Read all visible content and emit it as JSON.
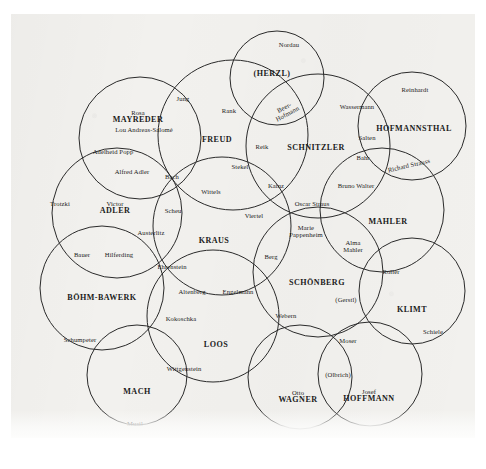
{
  "document": {
    "type": "venn-diagram-sociogram",
    "subject": "Vienna fin-de-siecle intellectual circles",
    "header_ghost_text": "",
    "background_color": "#f2f1ee",
    "ink_color": "#1b1b1b",
    "circle_stroke_color": "#2a2a2a"
  },
  "circles": [
    {
      "id": "mayreder",
      "cx": 140,
      "cy": 138,
      "r": 61
    },
    {
      "id": "freud",
      "cx": 233,
      "cy": 135,
      "r": 75
    },
    {
      "id": "herzl",
      "cx": 277,
      "cy": 78,
      "r": 47
    },
    {
      "id": "schnitzler",
      "cx": 318,
      "cy": 146,
      "r": 72
    },
    {
      "id": "hofmannsthal",
      "cx": 412,
      "cy": 126,
      "r": 54
    },
    {
      "id": "victor_adler",
      "cx": 117,
      "cy": 213,
      "r": 65
    },
    {
      "id": "kraus",
      "cx": 222,
      "cy": 226,
      "r": 69
    },
    {
      "id": "mahler",
      "cx": 382,
      "cy": 210,
      "r": 62
    },
    {
      "id": "schonberg",
      "cx": 318,
      "cy": 272,
      "r": 65
    },
    {
      "id": "bohm_bawerk",
      "cx": 102,
      "cy": 288,
      "r": 62
    },
    {
      "id": "loos",
      "cx": 213,
      "cy": 316,
      "r": 66
    },
    {
      "id": "klimt",
      "cx": 412,
      "cy": 291,
      "r": 53
    },
    {
      "id": "mach",
      "cx": 137,
      "cy": 375,
      "r": 50
    },
    {
      "id": "josef_hoffmann",
      "cx": 370,
      "cy": 374,
      "r": 52
    },
    {
      "id": "otto_wagner",
      "cx": 300,
      "cy": 377,
      "r": 52
    }
  ],
  "major_labels": [
    {
      "id": "mayreder",
      "given": "Rosa",
      "family": "MAYREDER",
      "x": 138,
      "y": 117
    },
    {
      "id": "freud",
      "given": "",
      "family": "FREUD",
      "x": 217,
      "y": 140
    },
    {
      "id": "herzl",
      "given": "",
      "family": "(HERZL)",
      "x": 272,
      "y": 74
    },
    {
      "id": "schnitzler",
      "given": "",
      "family": "SCHNITZLER",
      "x": 316,
      "y": 148
    },
    {
      "id": "hofmannsthal",
      "given": "",
      "family": "HOFMANNSTHAL",
      "x": 414,
      "y": 129
    },
    {
      "id": "victor_adler",
      "given": "Victor",
      "family": "ADLER",
      "x": 115,
      "y": 208
    },
    {
      "id": "kraus",
      "given": "",
      "family": "KRAUS",
      "x": 214,
      "y": 241
    },
    {
      "id": "mahler",
      "given": "",
      "family": "MAHLER",
      "x": 388,
      "y": 222
    },
    {
      "id": "schonberg",
      "given": "",
      "family": "SCHÖNBERG",
      "x": 317,
      "y": 283
    },
    {
      "id": "bohm_bawerk",
      "given": "",
      "family": "BÖHM-BAWERK",
      "x": 102,
      "y": 298
    },
    {
      "id": "loos",
      "given": "",
      "family": "LOOS",
      "x": 216,
      "y": 345
    },
    {
      "id": "klimt",
      "given": "",
      "family": "KLIMT",
      "x": 412,
      "y": 310
    },
    {
      "id": "mach",
      "given": "",
      "family": "MACH",
      "x": 137,
      "y": 392
    },
    {
      "id": "josef_hoffmann",
      "given": "Josef",
      "family": "HOFFMANN",
      "x": 369,
      "y": 396
    },
    {
      "id": "otto_wagner",
      "given": "Otto",
      "family": "WAGNER",
      "x": 298,
      "y": 397
    }
  ],
  "minor_labels": [
    {
      "id": "nordau",
      "text": "Nordau",
      "x": 289,
      "y": 45
    },
    {
      "id": "reinhardt",
      "text": "Reinhardt",
      "x": 415,
      "y": 90
    },
    {
      "id": "jung",
      "text": "Jung",
      "x": 183,
      "y": 99
    },
    {
      "id": "rank",
      "text": "Rank",
      "x": 229,
      "y": 111
    },
    {
      "id": "wassermann",
      "text": "Wassermann",
      "x": 357,
      "y": 107
    },
    {
      "id": "beer_hofmann",
      "text": "Beer-",
      "text2": "Hofmann",
      "x": 286,
      "y": 111,
      "rotate": -28
    },
    {
      "id": "rosa_popp",
      "text": "Adelheid Popp",
      "x": 113,
      "y": 152
    },
    {
      "id": "lou_andreas",
      "text": "Lou Andreas-Salomé",
      "x": 144,
      "y": 130
    },
    {
      "id": "salten",
      "text": "Salten",
      "x": 367,
      "y": 138
    },
    {
      "id": "bahr",
      "text": "Bahr",
      "x": 363,
      "y": 158
    },
    {
      "id": "richard_strauss",
      "text": "Richard Strauss",
      "x": 409,
      "y": 166,
      "rotate": -13
    },
    {
      "id": "reik",
      "text": "Reik",
      "x": 262,
      "y": 147
    },
    {
      "id": "stekel",
      "text": "Stekel",
      "x": 240,
      "y": 167
    },
    {
      "id": "alfred_adler",
      "text": "Alfred Adler",
      "x": 132,
      "y": 172
    },
    {
      "id": "bach",
      "text": "Bach",
      "x": 172,
      "y": 177
    },
    {
      "id": "wittels",
      "text": "Wittels",
      "x": 211,
      "y": 192
    },
    {
      "id": "kainz",
      "text": "Kainz",
      "x": 276,
      "y": 186
    },
    {
      "id": "bruno_walter",
      "text": "Bruno Walter",
      "x": 356,
      "y": 186
    },
    {
      "id": "trotzki",
      "text": "Trotzki",
      "x": 60,
      "y": 204
    },
    {
      "id": "scheu",
      "text": "Scheu",
      "x": 173,
      "y": 211
    },
    {
      "id": "viertel",
      "text": "Viertel",
      "x": 254,
      "y": 216
    },
    {
      "id": "oscar_straus",
      "text": "Oscar Straus",
      "x": 312,
      "y": 204
    },
    {
      "id": "austerlitz",
      "text": "Austerlitz",
      "x": 151,
      "y": 233
    },
    {
      "id": "marie_pappenheim",
      "text": "Marie",
      "text2": "Pappenheim",
      "x": 306,
      "y": 232
    },
    {
      "id": "bauer",
      "text": "Bauer",
      "x": 82,
      "y": 255
    },
    {
      "id": "hilferding",
      "text": "Hilferding",
      "x": 119,
      "y": 255
    },
    {
      "id": "berg",
      "text": "Berg",
      "x": 271,
      "y": 257
    },
    {
      "id": "alma_mahler",
      "text": "Alma",
      "text2": "Mahler",
      "x": 353,
      "y": 247
    },
    {
      "id": "ehrenstein",
      "text": "Ehrenstein",
      "x": 172,
      "y": 267
    },
    {
      "id": "roller",
      "text": "Roller",
      "x": 391,
      "y": 272
    },
    {
      "id": "altenberg",
      "text": "Altenberg",
      "x": 192,
      "y": 292
    },
    {
      "id": "engelmann",
      "text": "Engelmann",
      "x": 238,
      "y": 292
    },
    {
      "id": "gerstl",
      "text": "(Gerstl)",
      "x": 346,
      "y": 300
    },
    {
      "id": "webern",
      "text": "Webern",
      "x": 286,
      "y": 316
    },
    {
      "id": "kokoschka",
      "text": "Kokoschka",
      "x": 181,
      "y": 319
    },
    {
      "id": "schiele",
      "text": "Schiele",
      "x": 433,
      "y": 332
    },
    {
      "id": "moser",
      "text": "Moser",
      "x": 348,
      "y": 341
    },
    {
      "id": "schumpeter",
      "text": "Schumpeter",
      "x": 80,
      "y": 340
    },
    {
      "id": "wittgenstein",
      "text": "Wittgenstein",
      "x": 184,
      "y": 369
    },
    {
      "id": "olbrich",
      "text": "(Olbrich)",
      "x": 338,
      "y": 375
    },
    {
      "id": "musil",
      "text": "Musil",
      "x": 135,
      "y": 424
    }
  ]
}
